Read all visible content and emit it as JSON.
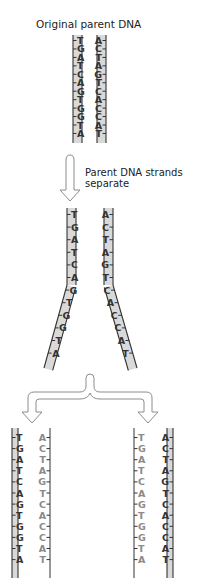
{
  "title": "Original parent DNA",
  "separation_label_line1": "Parent DNA strands",
  "separation_label_line2": "separate",
  "colors": {
    "backbone_line": "#333333",
    "backbone_fill": "#d9d9d9",
    "parental_base": "#333333",
    "new_base": "#8a8a8a",
    "arrow_stroke": "#8c8c8c",
    "arrow_fill": "#ffffff"
  },
  "parent_strand_left": [
    "T",
    "G",
    "A",
    "T",
    "C",
    "A",
    "G",
    "T",
    "G",
    "G",
    "T",
    "A"
  ],
  "parent_strand_right": [
    "A",
    "C",
    "T",
    "A",
    "G",
    "T",
    "C",
    "A",
    "C",
    "C",
    "A",
    "T"
  ],
  "separating": {
    "paired_rows": 6,
    "left_strand": [
      "T",
      "G",
      "A",
      "T",
      "C",
      "A",
      "G",
      "T",
      "G",
      "G",
      "T",
      "A"
    ],
    "right_strand": [
      "A",
      "C",
      "T",
      "A",
      "G",
      "T",
      "C",
      "A",
      "C",
      "C",
      "A",
      "T"
    ]
  },
  "daughters": [
    {
      "name": "left-daughter",
      "parental_side": "left",
      "left_strand": [
        "T",
        "G",
        "A",
        "T",
        "C",
        "A",
        "G",
        "T",
        "G",
        "G",
        "T",
        "A"
      ],
      "right_strand": [
        "A",
        "C",
        "T",
        "A",
        "G",
        "T",
        "C",
        "A",
        "C",
        "C",
        "A",
        "T"
      ]
    },
    {
      "name": "right-daughter",
      "parental_side": "right",
      "left_strand": [
        "T",
        "G",
        "A",
        "T",
        "C",
        "A",
        "G",
        "T",
        "G",
        "G",
        "T",
        "A"
      ],
      "right_strand": [
        "A",
        "C",
        "T",
        "A",
        "G",
        "T",
        "C",
        "A",
        "C",
        "C",
        "A",
        "T"
      ]
    }
  ]
}
